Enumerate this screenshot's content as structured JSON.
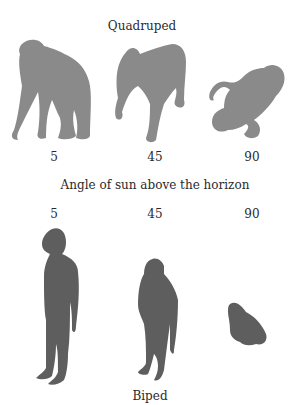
{
  "title_top": "Quadruped",
  "caption": "Angle of sun above the horizon",
  "title_bottom": "Biped",
  "colors": {
    "quadruped_shadow": "#8a8a8a",
    "biped_shadow": "#5e5e5e"
  },
  "quadruped": {
    "angles": [
      "5",
      "45",
      "90"
    ]
  },
  "biped": {
    "angles": [
      "5",
      "45",
      "90"
    ]
  }
}
